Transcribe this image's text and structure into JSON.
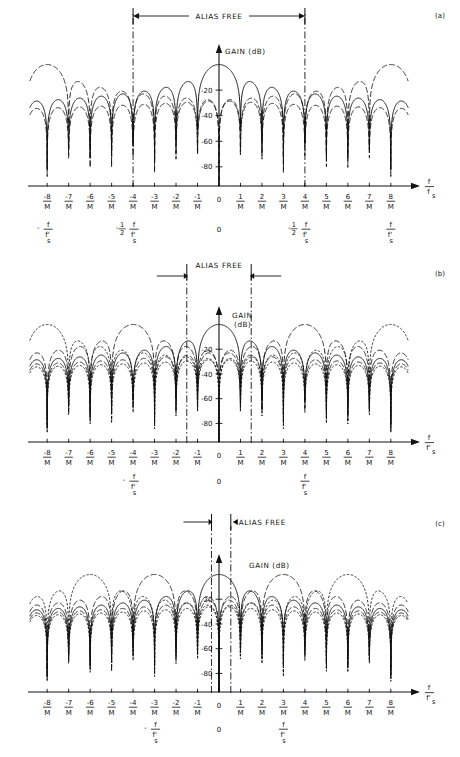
{
  "figure": {
    "title_label_a": "(a)",
    "title_label_b": "(b)",
    "title_label_c": "(c)",
    "alias_free_label": "ALIAS FREE",
    "gain_label": "GAIN (dB)",
    "gain_label_line1": "GAIN",
    "gain_label_line2": "(dB)",
    "zero_label": "0"
  },
  "colors": {
    "ink": "#111111",
    "axis": "#111111",
    "background": "#ffffff"
  },
  "chart_data": [
    {
      "type": "line",
      "panel": "a",
      "title": "ALIAS FREE",
      "xlabel": "f / f_s",
      "ylabel": "GAIN (dB)",
      "ylim": [
        -95,
        2
      ],
      "xlim": [
        -8.8,
        8.8
      ],
      "yticks": [
        -20,
        -40,
        -60,
        -80
      ],
      "ytick_labels": [
        "-20",
        "-40",
        "-60",
        "-80"
      ],
      "xticks": [
        -8,
        -7,
        -6,
        -5,
        -4,
        -3,
        -2,
        -1,
        0,
        1,
        2,
        3,
        4,
        5,
        6,
        7,
        8
      ],
      "xtick_numerators": [
        "-8",
        "-7",
        "-6",
        "-5",
        "-4",
        "-3",
        "-2",
        "-1",
        "0",
        "1",
        "2",
        "3",
        "4",
        "5",
        "6",
        "7",
        "8"
      ],
      "xtick_denominator": "M",
      "alias_free_range": [
        -4,
        4
      ],
      "marker_positions": [
        -4,
        4
      ],
      "aux_axis_labels": [
        {
          "text_num": "- f",
          "text_den": "f'",
          "sub": "s",
          "x": -8
        },
        {
          "text_num": "-1/2 f",
          "text_den": "f'",
          "sub": "s",
          "x": -4
        },
        {
          "text_num": "0",
          "text_den": "",
          "sub": "",
          "x": 0
        },
        {
          "text_num": "-1/2 f",
          "text_den": "f'",
          "sub": "s",
          "x": 4
        },
        {
          "text_num": "f",
          "text_den": "f'",
          "sub": "s",
          "x": 8
        }
      ],
      "series": [
        {
          "name": "main-lobe-solid",
          "style": "solid",
          "center": 0,
          "lobe_half_width": 3
        },
        {
          "name": "image-dashed",
          "style": "dashed",
          "center": -8,
          "lobe_half_width": 3
        },
        {
          "name": "image-dashed",
          "style": "dashed",
          "center": 8,
          "lobe_half_width": 3
        }
      ]
    },
    {
      "type": "line",
      "panel": "b",
      "title": "ALIAS FREE",
      "xlabel": "f / f'_s",
      "ylabel": "GAIN (dB)",
      "ylim": [
        -95,
        2
      ],
      "xlim": [
        -8.8,
        8.8
      ],
      "yticks": [
        -20,
        -40,
        -60,
        -80
      ],
      "ytick_labels": [
        "-20",
        "-40",
        "-60",
        "-80"
      ],
      "xticks": [
        -8,
        -7,
        -6,
        -5,
        -4,
        -3,
        -2,
        -1,
        0,
        1,
        2,
        3,
        4,
        5,
        6,
        7,
        8
      ],
      "xtick_numerators": [
        "-8",
        "-7",
        "-6",
        "-5",
        "-4",
        "-3",
        "-2",
        "-1",
        "0",
        "1",
        "2",
        "3",
        "4",
        "5",
        "6",
        "7",
        "8"
      ],
      "xtick_denominator": "M",
      "alias_free_range": [
        -1.5,
        1.5
      ],
      "marker_positions": [
        -1.5,
        1.5
      ],
      "aux_axis_labels": [
        {
          "text_num": "- f",
          "text_den": "f'",
          "sub": "s",
          "x": -4
        },
        {
          "text_num": "0",
          "text_den": "",
          "sub": "",
          "x": 0
        },
        {
          "text_num": "f",
          "text_den": "f'",
          "sub": "s",
          "x": 4
        }
      ],
      "series": [
        {
          "name": "main-lobe-solid",
          "style": "solid",
          "center": 0,
          "lobe_half_width": 3
        },
        {
          "name": "alias-dashed-left",
          "style": "dashed",
          "center": -4,
          "lobe_half_width": 3
        },
        {
          "name": "alias-dashed-right",
          "style": "dashed",
          "center": 4,
          "lobe_half_width": 3
        },
        {
          "name": "alias-dotted-left",
          "style": "dotted",
          "center": -8,
          "lobe_half_width": 3
        },
        {
          "name": "alias-dotted-right",
          "style": "dotted",
          "center": 8,
          "lobe_half_width": 3
        }
      ]
    },
    {
      "type": "line",
      "panel": "c",
      "title": "ALIAS FREE",
      "xlabel": "f / f'_s",
      "ylabel": "GAIN (dB)",
      "ylim": [
        -95,
        2
      ],
      "xlim": [
        -8.8,
        8.8
      ],
      "yticks": [
        -20,
        -40,
        -60,
        -80
      ],
      "ytick_labels": [
        "-20",
        "-40",
        "-60",
        "-80"
      ],
      "xticks": [
        -8,
        -7,
        -6,
        -5,
        -4,
        -3,
        -2,
        -1,
        0,
        1,
        2,
        3,
        4,
        5,
        6,
        7,
        8
      ],
      "xtick_numerators": [
        "-8",
        "-7",
        "-6",
        "-5",
        "-4",
        "-3",
        "-2",
        "-1",
        "0",
        "1",
        "2",
        "3",
        "4",
        "5",
        "6",
        "7",
        "8"
      ],
      "xtick_denominator": "M",
      "alias_free_range": [
        -0.35,
        0.55
      ],
      "marker_positions": [
        -0.35,
        0.55
      ],
      "aux_axis_labels": [
        {
          "text_num": "- f",
          "text_den": "f'",
          "sub": "s",
          "x": -3
        },
        {
          "text_num": "0",
          "text_den": "",
          "sub": "",
          "x": 0
        },
        {
          "text_num": "f",
          "text_den": "f'",
          "sub": "s",
          "x": 3
        }
      ],
      "series": [
        {
          "name": "main-lobe-solid",
          "style": "solid",
          "center": 0,
          "lobe_half_width": 3
        },
        {
          "name": "alias-dashed-left",
          "style": "dashed",
          "center": -3,
          "lobe_half_width": 3
        },
        {
          "name": "alias-dashed-right",
          "style": "dashed",
          "center": 3,
          "lobe_half_width": 3
        },
        {
          "name": "alias-dotted-left",
          "style": "dotted",
          "center": -6,
          "lobe_half_width": 3
        },
        {
          "name": "alias-dotted-right",
          "style": "dotted",
          "center": 6,
          "lobe_half_width": 3
        }
      ]
    }
  ]
}
